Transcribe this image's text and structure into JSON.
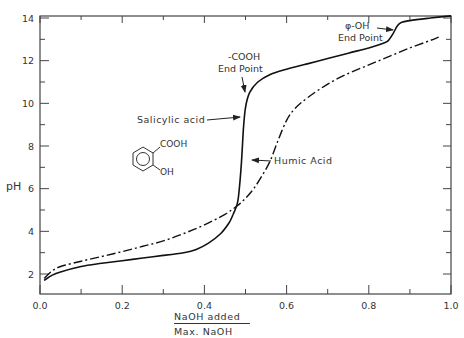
{
  "chart_data": {
    "type": "line",
    "title": "",
    "xlabel_numerator": "NaOH added",
    "xlabel_denominator": "Max. NaOH",
    "ylabel": "pH",
    "xlim": [
      0.0,
      1.0
    ],
    "ylim": [
      1.1,
      14.1
    ],
    "grid": false,
    "x_ticks": [
      0.0,
      0.2,
      0.4,
      0.6,
      0.8,
      1.0
    ],
    "x_tick_labels": [
      "0.0",
      "0.2",
      "0.4",
      "0.6",
      "0.8",
      "1.0"
    ],
    "x_minor_ticks": [
      0.1,
      0.3,
      0.5,
      0.7,
      0.9
    ],
    "y_ticks": [
      2,
      4,
      6,
      8,
      10,
      12,
      14
    ],
    "y_tick_labels": [
      "2",
      "4",
      "6",
      "8",
      "10",
      "12",
      "14"
    ],
    "y_minor_ticks": [
      3,
      5,
      7,
      9,
      11,
      13
    ],
    "series": [
      {
        "name": "Salicylic acid",
        "style": "solid",
        "x": [
          0.01,
          0.03,
          0.05,
          0.1,
          0.15,
          0.2,
          0.25,
          0.3,
          0.35,
          0.38,
          0.41,
          0.44,
          0.46,
          0.47,
          0.48,
          0.485,
          0.49,
          0.495,
          0.5,
          0.51,
          0.53,
          0.56,
          0.6,
          0.65,
          0.7,
          0.75,
          0.8,
          0.84,
          0.85,
          0.86,
          0.87,
          0.88,
          0.9,
          0.95,
          1.0
        ],
        "y": [
          1.7,
          1.95,
          2.1,
          2.35,
          2.5,
          2.62,
          2.75,
          2.87,
          3.0,
          3.15,
          3.45,
          3.9,
          4.4,
          4.8,
          5.3,
          6.0,
          7.2,
          8.8,
          9.8,
          10.5,
          11.0,
          11.35,
          11.6,
          11.85,
          12.1,
          12.35,
          12.6,
          12.85,
          13.0,
          13.3,
          13.65,
          13.8,
          13.88,
          14.0,
          14.1
        ]
      },
      {
        "name": "Humic Acid",
        "style": "dash-dot",
        "x": [
          0.01,
          0.03,
          0.05,
          0.1,
          0.15,
          0.2,
          0.25,
          0.3,
          0.35,
          0.4,
          0.45,
          0.48,
          0.5,
          0.52,
          0.54,
          0.56,
          0.58,
          0.6,
          0.62,
          0.65,
          0.7,
          0.75,
          0.8,
          0.85,
          0.9,
          0.95,
          0.97
        ],
        "y": [
          1.8,
          2.15,
          2.35,
          2.6,
          2.82,
          3.05,
          3.3,
          3.55,
          3.9,
          4.3,
          4.8,
          5.2,
          5.55,
          6.0,
          6.6,
          7.3,
          8.3,
          9.2,
          9.75,
          10.25,
          10.9,
          11.4,
          11.8,
          12.2,
          12.6,
          12.95,
          13.1
        ]
      }
    ],
    "annotations": [
      {
        "text": [
          "-COOH",
          "End Point"
        ],
        "points_to": {
          "x": 0.495,
          "y": 9.3
        }
      },
      {
        "text": [
          "φ-OH",
          "End Point"
        ],
        "points_to": {
          "x": 0.865,
          "y": 13.5
        }
      },
      {
        "text": [
          "Salicylic acid"
        ],
        "points_to": {
          "x": 0.49,
          "y": 8.4
        }
      },
      {
        "text": [
          "Humic Acid"
        ],
        "points_to": {
          "x": 0.575,
          "y": 8.0
        }
      },
      {
        "text": [
          "COOH",
          "OH"
        ],
        "structure": "salicylic-acid-benzene-ring"
      }
    ]
  },
  "labels": {
    "ylabel": "pH",
    "xlabel_numerator": "NaOH added",
    "xlabel_denominator": "Max. NaOH",
    "cooh_line1": "-COOH",
    "cooh_line2": "End Point",
    "phoh_line1": "φ-OH",
    "phoh_line2": "End Point",
    "salicylic": "Salicylic acid",
    "humic": "Humic Acid",
    "struct_cooh": "COOH",
    "struct_oh": "OH"
  }
}
